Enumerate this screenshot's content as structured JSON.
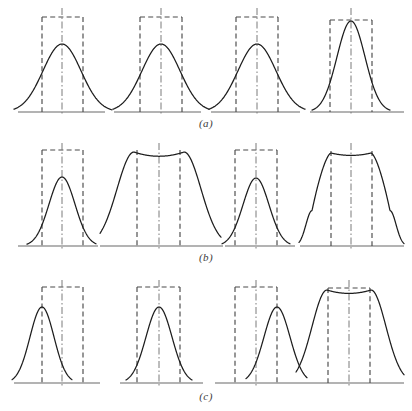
{
  "figure": {
    "width": 412,
    "height": 411,
    "background": "#ffffff"
  },
  "style": {
    "curve_color": "#1d1d1d",
    "curve_width": 1.25,
    "dashed_color": "#4a4a4a",
    "dashed_width": 1.15,
    "dash_pattern": "5,3.2",
    "centerline_color": "#7a7a7a",
    "centerline_width": 1.0,
    "centerline_pattern": "7,2.5,1.5,2.5",
    "baseline_color": "#9a9a9a",
    "baseline_width": 1.3,
    "caption_color": "#3b3b3b"
  },
  "rows": [
    {
      "id": "a",
      "caption": "(a)",
      "caption_x": 206,
      "caption_y": 117,
      "baseline_y": 112,
      "top_y": 16,
      "panels": [
        {
          "name": "panel-a-1",
          "baseline": [
            18,
            105
          ],
          "rect": {
            "x0": 42,
            "x1": 83,
            "top": 17,
            "show_top": true
          },
          "center": 62,
          "centerline": {
            "top": 8
          },
          "curve": {
            "type": "gauss",
            "peak_x": 62,
            "peak_y": 44,
            "sigma": 19,
            "x0": 14,
            "x1": 112,
            "flat": 0
          }
        },
        {
          "name": "panel-a-2",
          "baseline": [
            114,
            201
          ],
          "rect": {
            "x0": 140,
            "x1": 182,
            "top": 17,
            "show_top": true
          },
          "center": 161,
          "centerline": {
            "top": 8
          },
          "curve": {
            "type": "gauss",
            "peak_x": 161,
            "peak_y": 44,
            "sigma": 19,
            "x0": 113,
            "x1": 209,
            "flat": 0
          }
        },
        {
          "name": "panel-a-3",
          "baseline": [
            211,
            300
          ],
          "rect": {
            "x0": 236,
            "x1": 278,
            "top": 17,
            "show_top": true
          },
          "center": 257,
          "centerline": {
            "top": 8
          },
          "curve": {
            "type": "gauss",
            "peak_x": 257,
            "peak_y": 44,
            "sigma": 19,
            "x0": 209,
            "x1": 305,
            "flat": 0
          }
        },
        {
          "name": "panel-a-4",
          "baseline": [
            310,
            404
          ],
          "rect": {
            "x0": 330,
            "x1": 372,
            "top": 20,
            "show_top": true
          },
          "center": 351,
          "centerline": {
            "top": 8
          },
          "curve": {
            "type": "gauss",
            "peak_x": 351,
            "peak_y": 21,
            "sigma": 14,
            "x0": 312,
            "x1": 390,
            "flat": 0
          }
        }
      ]
    },
    {
      "id": "b",
      "caption": "(b)",
      "caption_x": 206,
      "caption_y": 251,
      "baseline_y": 246,
      "top_y": 150,
      "panels": [
        {
          "name": "panel-b-1",
          "baseline": [
            18,
            98
          ],
          "rect": {
            "x0": 42,
            "x1": 83,
            "top": 150,
            "show_top": true
          },
          "center": 62,
          "centerline": {
            "top": 143
          },
          "curve": {
            "type": "gauss",
            "peak_x": 62,
            "peak_y": 177,
            "sigma": 13,
            "x0": 27,
            "x1": 96,
            "flat": 0
          }
        },
        {
          "name": "panel-b-2",
          "baseline": [
            100,
            223
          ],
          "rect": {
            "x0": 137,
            "x1": 180,
            "top": 150,
            "show_top": false
          },
          "center": 159,
          "centerline": {
            "top": 143
          },
          "curve": {
            "type": "flattop",
            "peak_x": 159,
            "peak_y": 152,
            "half_flat": 25,
            "sigma": 17,
            "x0": 100,
            "x1": 221,
            "dip": 5
          }
        },
        {
          "name": "panel-b-3",
          "baseline": [
            225,
            295
          ],
          "rect": {
            "x0": 235,
            "x1": 277,
            "top": 150,
            "show_top": true
          },
          "center": 256,
          "centerline": {
            "top": 143
          },
          "curve": {
            "type": "gauss",
            "peak_x": 256,
            "peak_y": 178,
            "sigma": 13,
            "x0": 222,
            "x1": 290,
            "flat": 0
          }
        },
        {
          "name": "panel-b-4",
          "baseline": [
            300,
            404
          ],
          "rect": {
            "x0": 331,
            "x1": 372,
            "top": 151,
            "show_top": false
          },
          "center": 351,
          "centerline": {
            "top": 143
          },
          "curve": {
            "type": "steepflat",
            "peak_x": 351,
            "peak_y": 153,
            "half_flat": 20,
            "shoulder": 39,
            "tail": 52,
            "x0": 299,
            "x1": 404,
            "dip": 3
          }
        }
      ]
    },
    {
      "id": "c",
      "caption": "(c)",
      "caption_x": 206,
      "caption_y": 390,
      "baseline_y": 383,
      "top_y": 286,
      "panels": [
        {
          "name": "panel-c-1",
          "baseline": [
            14,
            100
          ],
          "rect": {
            "x0": 42,
            "x1": 83,
            "top": 287,
            "show_top": true
          },
          "center": 62,
          "centerline": {
            "top": 280
          },
          "curve": {
            "type": "gauss",
            "peak_x": 42,
            "peak_y": 307,
            "sigma": 12,
            "x0": 12,
            "x1": 72,
            "flat": 0
          }
        },
        {
          "name": "panel-c-2",
          "baseline": [
            120,
            203
          ],
          "rect": {
            "x0": 137,
            "x1": 180,
            "top": 287,
            "show_top": true
          },
          "center": 159,
          "centerline": {
            "top": 280
          },
          "curve": {
            "type": "gauss",
            "peak_x": 159,
            "peak_y": 307,
            "sigma": 13,
            "x0": 126,
            "x1": 192,
            "flat": 0
          }
        },
        {
          "name": "panel-c-3",
          "baseline": [
            215,
            300
          ],
          "rect": {
            "x0": 235,
            "x1": 277,
            "top": 287,
            "show_top": true
          },
          "center": 256,
          "centerline": {
            "top": 280
          },
          "curve": {
            "type": "gauss",
            "peak_x": 277,
            "peak_y": 307,
            "sigma": 13,
            "x0": 246,
            "x1": 307,
            "flat": 0
          }
        },
        {
          "name": "panel-c-4",
          "baseline": [
            300,
            404
          ],
          "rect": {
            "x0": 328,
            "x1": 370,
            "top": 288,
            "show_top": true
          },
          "center": 349,
          "centerline": {
            "top": 280
          },
          "curve": {
            "type": "flattop",
            "peak_x": 349,
            "peak_y": 290,
            "half_flat": 22,
            "sigma": 15,
            "x0": 296,
            "x1": 404,
            "dip": 4
          }
        }
      ]
    }
  ]
}
